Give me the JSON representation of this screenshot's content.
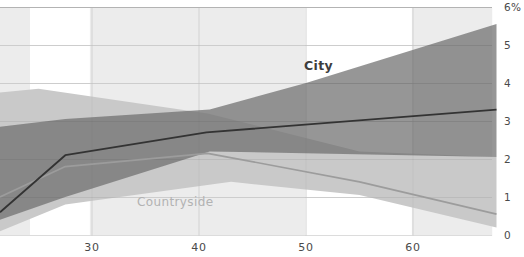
{
  "chart_data": {
    "type": "line",
    "title": "",
    "unit": "%",
    "grid": true,
    "legend_position": "inline-annotations",
    "x_axis": {
      "label": "",
      "tick_labels": [
        "30",
        "40",
        "50",
        "60"
      ],
      "tick_values": [
        30,
        40,
        50,
        60
      ],
      "range": [
        21.4,
        67.8
      ]
    },
    "y_axis": {
      "label": "",
      "side": "right",
      "tick_labels": [
        "0",
        "1",
        "2",
        "3",
        "4",
        "5",
        "6%"
      ],
      "tick_values": [
        0,
        1,
        2,
        3,
        4,
        5,
        6
      ],
      "range": [
        0,
        6
      ]
    },
    "highlight_columns": [
      {
        "from": 21.4,
        "to": 24.2
      },
      {
        "from": 29.8,
        "to": 49.9
      },
      {
        "from": 59.9,
        "to": 67.4
      }
    ],
    "series": [
      {
        "name": "City",
        "line_color": "#333333",
        "band_color": "rgba(110,110,110,0.72)",
        "line": {
          "x": [
            21.4,
            27.5,
            40.7,
            67.8
          ],
          "y": [
            0.6,
            2.1,
            2.7,
            3.3
          ]
        },
        "band": {
          "upper_x": [
            21.4,
            27.5,
            41,
            50,
            67.8
          ],
          "upper_y": [
            2.85,
            3.05,
            3.3,
            4.0,
            5.55
          ],
          "lower_x": [
            21.4,
            27.5,
            41,
            67.8
          ],
          "lower_y": [
            0.4,
            1.0,
            2.2,
            2.05
          ]
        },
        "label": {
          "text": "City",
          "x": 49.8,
          "y": 4.35
        }
      },
      {
        "name": "Countryside",
        "line_color": "#9c9c9c",
        "band_color": "#c9c9c9",
        "line": {
          "x": [
            21.4,
            27.5,
            40.8,
            55,
            67.8
          ],
          "y": [
            1.0,
            1.8,
            2.15,
            1.4,
            0.55
          ]
        },
        "band": {
          "upper_x": [
            21.4,
            25,
            40.8,
            55,
            67.8
          ],
          "upper_y": [
            3.75,
            3.85,
            3.2,
            2.2,
            2.05
          ],
          "lower_x": [
            21.4,
            27.5,
            43,
            55,
            67.8
          ],
          "lower_y": [
            0.1,
            0.8,
            1.4,
            1.05,
            0.2
          ]
        },
        "label": {
          "text": "Countryside",
          "x": 34.2,
          "y": 0.76
        }
      }
    ],
    "colors": {
      "background": "#ffffff",
      "column_fill": "#ececec",
      "grid_minor": "#dcdcdc",
      "grid_top": "#b3b3b3",
      "tick_text": "#4a4a4a"
    }
  }
}
